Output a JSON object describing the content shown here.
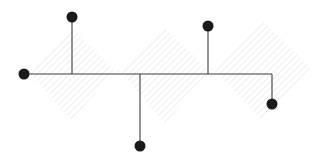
{
  "canvas": {
    "width": 317,
    "height": 157,
    "background_color": "#ffffff",
    "title": "Node link diagram over hatched zigzag band"
  },
  "style": {
    "node_fill_color": "#1a1a1a",
    "node_radius": 5.5,
    "edge_color": "#3c3c3c",
    "edge_width": 1.1,
    "hatch_line_color": "#d8d8d8",
    "hatch_line_width": 0.9,
    "hatch_spacing": 4.6,
    "hatch_angle_deg": 45
  },
  "baseline": {
    "y": 74,
    "x_start": 24,
    "x_end": 272
  },
  "nodes": [
    {
      "id": "n1",
      "name": "node-left",
      "x": 24,
      "y": 74,
      "label": ""
    },
    {
      "id": "n2",
      "name": "node-top-left",
      "x": 72,
      "y": 17,
      "label": ""
    },
    {
      "id": "n3",
      "name": "node-bottom-center",
      "x": 140,
      "y": 146,
      "label": ""
    },
    {
      "id": "n4",
      "name": "node-top-right",
      "x": 208,
      "y": 26,
      "label": ""
    },
    {
      "id": "n5",
      "name": "node-bottom-right",
      "x": 272,
      "y": 104,
      "label": ""
    }
  ],
  "edges": [
    {
      "id": "e1",
      "name": "edge-spine",
      "points": "24,74 272,74"
    },
    {
      "id": "e2",
      "name": "edge-to-top-left",
      "points": "72,74 72,17"
    },
    {
      "id": "e3",
      "name": "edge-to-bottom-center",
      "points": "140,74 140,146"
    },
    {
      "id": "e4",
      "name": "edge-to-top-right",
      "points": "208,74 208,26"
    },
    {
      "id": "e5",
      "name": "edge-to-bottom-right",
      "points": "272,74 272,104"
    }
  ],
  "hatch_region": {
    "name": "zigzag-band",
    "description": "Thick sawtooth band with 45 degree edges",
    "polygon": "30,74 72,28 118,74 165,28 212,74 262,20 310,68 262,120 212,68 165,124 118,68 72,120"
  }
}
